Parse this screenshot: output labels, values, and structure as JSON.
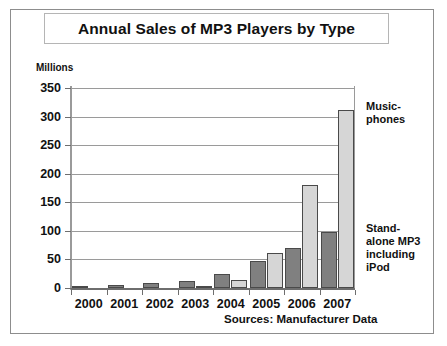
{
  "chart_data": {
    "type": "bar",
    "title": "Annual Sales of MP3 Players by Type",
    "xlabel": "",
    "ylabel": "Millions",
    "ylim": [
      0,
      350
    ],
    "ytick_step": 50,
    "yticks": [
      "350",
      "300",
      "250",
      "200",
      "150",
      "100",
      "50",
      "0"
    ],
    "grid": true,
    "legend_position": "right-annotations",
    "categories": [
      "2000",
      "2001",
      "2002",
      "2003",
      "2004",
      "2005",
      "2006",
      "2007"
    ],
    "series": [
      {
        "name": "Stand-alone MP3 including iPod",
        "color": "#808080",
        "values": [
          1,
          5,
          8,
          12,
          25,
          47,
          70,
          98
        ]
      },
      {
        "name": "Music-phones",
        "color": "#d6d6d6",
        "values": [
          0,
          0,
          0,
          3,
          14,
          62,
          181,
          311
        ]
      }
    ],
    "annotations": [
      "Music-\nphones",
      "Stand-\nalone MP3\nincluding\niPod"
    ],
    "source_note": "Sources: Manufacturer Data"
  },
  "figure": {
    "title": "Annual Sales of MP3 Players by Type",
    "y_unit_label": "Millions",
    "source_note": "Sources: Manufacturer Data",
    "annotation_musicphones_line1": "Music-",
    "annotation_musicphones_line2": "phones",
    "annotation_standalone_line1": "Stand-",
    "annotation_standalone_line2": "alone MP3",
    "annotation_standalone_line3": "including",
    "annotation_standalone_line4": "iPod"
  }
}
